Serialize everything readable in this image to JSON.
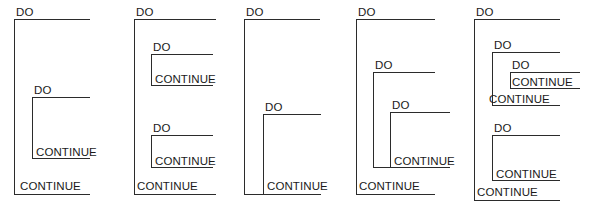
{
  "figure": {
    "keyword_do": "DO",
    "keyword_continue": "CONTINUE",
    "line_color": "#2b2b2b",
    "text_color": "#1a1a1a",
    "background_color": "#ffffff",
    "panel_count": 5
  },
  "panels": [
    {
      "name": "panel-1",
      "labels": [
        {
          "text": "DO",
          "x": 16,
          "y": 6
        },
        {
          "text": "DO",
          "x": 34,
          "y": 84
        },
        {
          "text": "CONTINUE",
          "x": 36,
          "y": 146
        },
        {
          "text": "CONTINUE",
          "x": 20,
          "y": 180
        }
      ],
      "brackets": [
        {
          "x": 14,
          "y": 19,
          "w": 76,
          "h": 176,
          "closed": true
        },
        {
          "x": 32,
          "y": 97,
          "w": 58,
          "h": 62,
          "closed": true
        }
      ],
      "rules": []
    },
    {
      "name": "panel-2",
      "labels": [
        {
          "text": "DO",
          "x": 136,
          "y": 6
        },
        {
          "text": "DO",
          "x": 153,
          "y": 41
        },
        {
          "text": "CONTINUE",
          "x": 155,
          "y": 73
        },
        {
          "text": "DO",
          "x": 153,
          "y": 122
        },
        {
          "text": "CONTINUE",
          "x": 155,
          "y": 155
        },
        {
          "text": "CONTINUE",
          "x": 137,
          "y": 180
        },
        {
          "text": "",
          "x": 0,
          "y": 0
        }
      ],
      "brackets": [
        {
          "x": 134,
          "y": 19,
          "w": 82,
          "h": 176,
          "closed": true
        },
        {
          "x": 151,
          "y": 54,
          "w": 62,
          "h": 32,
          "closed": true
        },
        {
          "x": 151,
          "y": 135,
          "w": 62,
          "h": 33,
          "closed": true
        }
      ],
      "rules": []
    },
    {
      "name": "panel-3",
      "labels": [
        {
          "text": "DO",
          "x": 246,
          "y": 6
        },
        {
          "text": "DO",
          "x": 265,
          "y": 101
        },
        {
          "text": "CONTINUE",
          "x": 267,
          "y": 180
        }
      ],
      "brackets": [
        {
          "x": 244,
          "y": 19,
          "w": 76,
          "h": 176,
          "closed": true
        },
        {
          "x": 263,
          "y": 114,
          "w": 58,
          "h": 81,
          "closed": true
        }
      ],
      "rules": []
    },
    {
      "name": "panel-4",
      "labels": [
        {
          "text": "DO",
          "x": 358,
          "y": 6
        },
        {
          "text": "DO",
          "x": 375,
          "y": 59
        },
        {
          "text": "DO",
          "x": 392,
          "y": 99
        },
        {
          "text": "CONTINUE",
          "x": 394,
          "y": 155
        },
        {
          "text": "CONTINUE",
          "x": 359,
          "y": 180
        }
      ],
      "brackets": [
        {
          "x": 356,
          "y": 19,
          "w": 79,
          "h": 176,
          "closed": true
        },
        {
          "x": 373,
          "y": 72,
          "w": 62,
          "h": 96,
          "closed": true
        },
        {
          "x": 390,
          "y": 112,
          "w": 60,
          "h": 56,
          "closed": true
        }
      ],
      "rules": []
    },
    {
      "name": "panel-5",
      "labels": [
        {
          "text": "DO",
          "x": 476,
          "y": 6
        },
        {
          "text": "DO",
          "x": 494,
          "y": 39
        },
        {
          "text": "DO",
          "x": 512,
          "y": 59
        },
        {
          "text": "CONTINUE",
          "x": 512,
          "y": 76
        },
        {
          "text": "CONTINUE",
          "x": 489,
          "y": 93
        },
        {
          "text": "DO",
          "x": 494,
          "y": 122
        },
        {
          "text": "CONTINUE",
          "x": 496,
          "y": 168
        },
        {
          "text": "CONTINUE",
          "x": 477,
          "y": 186
        }
      ],
      "brackets": [
        {
          "x": 474,
          "y": 19,
          "w": 86,
          "h": 182,
          "closed": true
        },
        {
          "x": 492,
          "y": 52,
          "w": 68,
          "h": 54,
          "closed": true
        },
        {
          "x": 510,
          "y": 72,
          "w": 70,
          "h": 17,
          "closed": true
        },
        {
          "x": 492,
          "y": 135,
          "w": 68,
          "h": 46,
          "closed": true
        }
      ],
      "rules": []
    }
  ]
}
